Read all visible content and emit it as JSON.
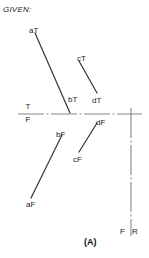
{
  "figure": {
    "given_label": "GIVEN:",
    "figure_caption": "(A)",
    "axis": {
      "true_label": "T",
      "false_label": "F",
      "front_label": "F",
      "right_label": "R"
    },
    "point_labels": [
      {
        "id": "aT",
        "text": "aT",
        "x": 29,
        "y": 26
      },
      {
        "id": "bT",
        "text": "bT",
        "x": 68,
        "y": 95
      },
      {
        "id": "cT",
        "text": "cT",
        "x": 77,
        "y": 54
      },
      {
        "id": "dT",
        "text": "dT",
        "x": 92,
        "y": 96
      },
      {
        "id": "bF",
        "text": "bF",
        "x": 56,
        "y": 130
      },
      {
        "id": "dF",
        "text": "dF",
        "x": 96,
        "y": 118
      },
      {
        "id": "cF",
        "text": "cF",
        "x": 73,
        "y": 155
      },
      {
        "id": "aF",
        "text": "aF",
        "x": 26,
        "y": 200
      }
    ],
    "lines": [
      {
        "id": "line-aT-bT",
        "from": "aT",
        "to": "bT",
        "x1": 35,
        "y1": 33,
        "x2": 70,
        "y2": 113
      },
      {
        "id": "line-cT-dT",
        "from": "cT",
        "to": "dT",
        "x1": 79,
        "y1": 61,
        "x2": 97,
        "y2": 93
      },
      {
        "id": "line-bF-aF",
        "from": "bF",
        "to": "aF",
        "x1": 62,
        "y1": 135,
        "x2": 31,
        "y2": 198
      },
      {
        "id": "line-dF-cF",
        "from": "dF",
        "to": "cF",
        "x1": 97,
        "y1": 123,
        "x2": 79,
        "y2": 152
      }
    ],
    "folding_line_horizontal": {
      "id": "fold-line-tf",
      "x1": 18,
      "y1": 114,
      "x2": 142,
      "y2": 114
    },
    "folding_line_vertical": {
      "id": "fold-line-fr",
      "x1": 131,
      "y1": 108,
      "x2": 131,
      "y2": 236
    },
    "colors": {
      "line_stroke": "#333333",
      "fold_line_stroke": "#777777",
      "text": "#222222",
      "background": "#ffffff"
    }
  }
}
